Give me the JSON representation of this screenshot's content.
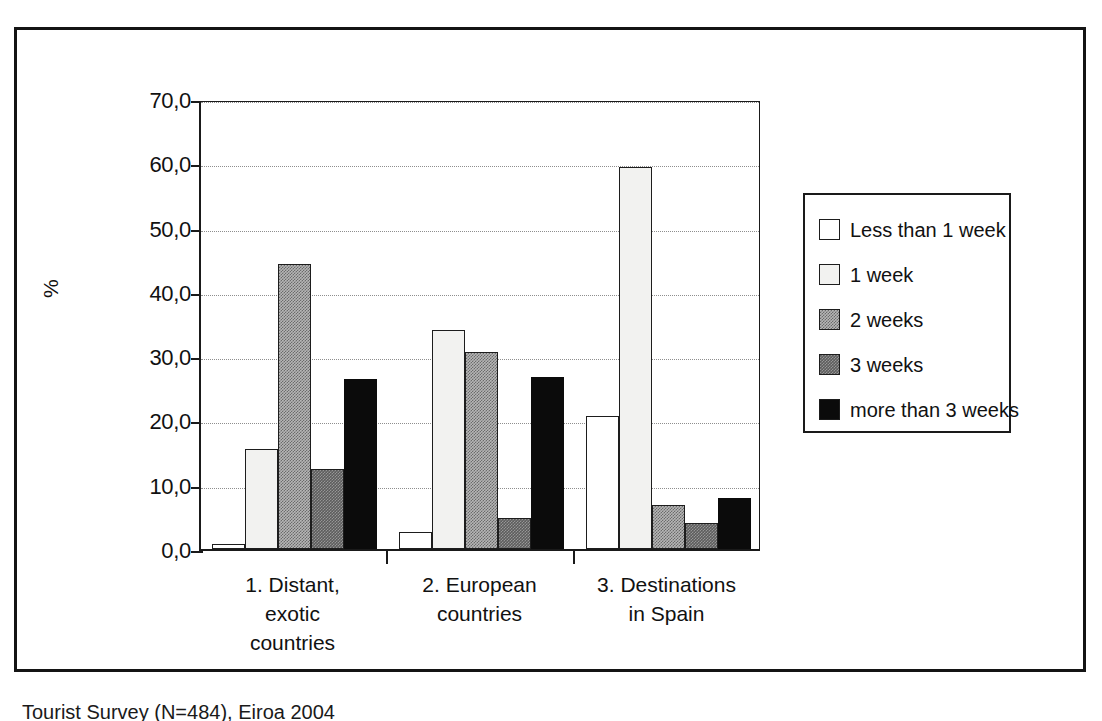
{
  "figure": {
    "caption": "Tourist Survey (N=484), Eiroa 2004"
  },
  "chart_data": {
    "type": "bar",
    "title": "",
    "subtitle": "",
    "xlabel": "",
    "ylabel": "%",
    "ylim": [
      0,
      70
    ],
    "ytick_labels": [
      "70,0",
      "60,0",
      "50,0",
      "40,0",
      "30,0",
      "20,0",
      "10,0",
      "0,0"
    ],
    "ytick_values": [
      70,
      60,
      50,
      40,
      30,
      20,
      10,
      0
    ],
    "grid": true,
    "grid_style": "dotted-horizontal",
    "legend_position": "right",
    "categories": [
      "1. Distant, exotic countries",
      "2. European countries",
      "3. Destinations in Spain"
    ],
    "category_lines": [
      [
        "1. Distant,",
        "exotic",
        "countries"
      ],
      [
        "2. European",
        "countries"
      ],
      [
        "3. Destinations",
        "in Spain"
      ]
    ],
    "series": [
      {
        "name": "Less than 1 week",
        "values": [
          0.8,
          2.6,
          20.7
        ],
        "fill": "white",
        "color": "#ffffff"
      },
      {
        "name": "1 week",
        "values": [
          15.5,
          34.0,
          59.5
        ],
        "fill": "offwhite",
        "color": "#f2f2f0"
      },
      {
        "name": "2 weeks",
        "values": [
          44.4,
          30.7,
          6.8
        ],
        "fill": "midgray",
        "color": "#b6b6b6"
      },
      {
        "name": "3 weeks",
        "values": [
          12.5,
          4.8,
          4.1
        ],
        "fill": "darkgray",
        "color": "#5d5d5d"
      },
      {
        "name": "more than 3 weeks",
        "values": [
          26.4,
          26.7,
          7.9
        ],
        "fill": "black",
        "color": "#0b0b0b"
      }
    ]
  }
}
